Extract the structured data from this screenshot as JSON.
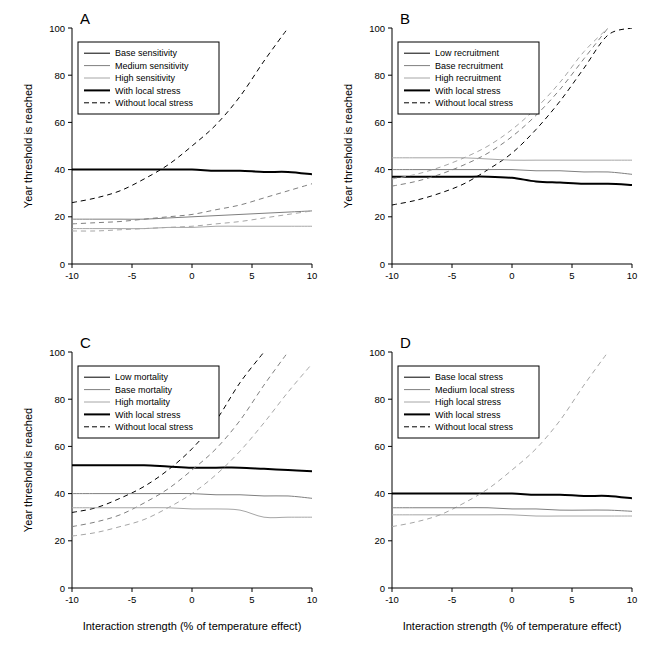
{
  "figure": {
    "background": "#ffffff",
    "axis_color": "#000000",
    "colors": {
      "black": "#000000",
      "dark_gray": "#4d4d4d",
      "mid_gray": "#7f7f7f",
      "light_gray": "#a6a6a6"
    },
    "y_axis": {
      "title": "Year threshold is reached",
      "ticks": [
        "0",
        "20",
        "40",
        "60",
        "80",
        "100"
      ],
      "min": 0,
      "max": 100
    },
    "x_axis": {
      "title": "Interaction strength (% of temperature effect)",
      "ticks": [
        "-10",
        "-5",
        "0",
        "5",
        "10"
      ],
      "min": -10,
      "max": 10
    }
  },
  "chart_data": [
    {
      "type": "line",
      "panel": "A",
      "title": "A",
      "xlabel": "",
      "ylabel": "Year threshold is reached",
      "xlim": [
        -10,
        10
      ],
      "ylim": [
        0,
        100
      ],
      "grid": false,
      "legend_position": "top-left",
      "legend": [
        {
          "label": "Base sensitivity",
          "color": "#000000",
          "dash": "solid",
          "width": 1
        },
        {
          "label": "Medium sensitivity",
          "color": "#7f7f7f",
          "dash": "solid",
          "width": 1
        },
        {
          "label": "High sensitivity",
          "color": "#a6a6a6",
          "dash": "solid",
          "width": 1
        },
        {
          "label": "With local stress",
          "color": "#000000",
          "dash": "solid",
          "width": 2
        },
        {
          "label": "Without local stress",
          "color": "#000000",
          "dash": "dashed",
          "width": 1
        }
      ],
      "x": [
        -10,
        -8,
        -6,
        -4,
        -2,
        0,
        2,
        4,
        6,
        8,
        10
      ],
      "series": [
        {
          "name": "Base sensitivity, with local stress",
          "color": "#000000",
          "dash": "solid",
          "width": 2,
          "values": [
            40,
            40,
            40,
            40,
            40,
            40,
            39.5,
            39.5,
            39,
            39,
            38
          ]
        },
        {
          "name": "Base sensitivity, without local stress",
          "color": "#000000",
          "dash": "dashed",
          "width": 1,
          "values": [
            26,
            28,
            31,
            36,
            42,
            50,
            59,
            71,
            86,
            100,
            null
          ]
        },
        {
          "name": "Medium sensitivity, with local stress",
          "color": "#7f7f7f",
          "dash": "solid",
          "width": 1,
          "values": [
            19,
            19,
            19,
            19,
            19.5,
            20,
            20.5,
            21,
            21.5,
            22,
            22.5
          ]
        },
        {
          "name": "Medium sensitivity, without local stress",
          "color": "#7f7f7f",
          "dash": "dashed",
          "width": 1,
          "values": [
            17,
            17.5,
            18,
            19,
            20,
            21,
            23,
            25,
            28,
            31,
            34
          ]
        },
        {
          "name": "High sensitivity, with local stress",
          "color": "#a6a6a6",
          "dash": "solid",
          "width": 1,
          "values": [
            15,
            15,
            15,
            15,
            15.5,
            15.5,
            16,
            16,
            16,
            16,
            16
          ]
        },
        {
          "name": "High sensitivity, without local stress",
          "color": "#a6a6a6",
          "dash": "dashed",
          "width": 1,
          "values": [
            14,
            14,
            14.5,
            15,
            15.5,
            16,
            17,
            18,
            19.5,
            21,
            22.5
          ]
        }
      ]
    },
    {
      "type": "line",
      "panel": "B",
      "title": "B",
      "xlabel": "",
      "ylabel": "Year threshold is reached",
      "xlim": [
        -10,
        10
      ],
      "ylim": [
        0,
        100
      ],
      "grid": false,
      "legend_position": "top-left",
      "legend": [
        {
          "label": "Low recruitment",
          "color": "#000000",
          "dash": "solid",
          "width": 1
        },
        {
          "label": "Base recruitment",
          "color": "#7f7f7f",
          "dash": "solid",
          "width": 1
        },
        {
          "label": "High recruitment",
          "color": "#a6a6a6",
          "dash": "solid",
          "width": 1
        },
        {
          "label": "With local stress",
          "color": "#000000",
          "dash": "solid",
          "width": 2
        },
        {
          "label": "Without local stress",
          "color": "#000000",
          "dash": "dashed",
          "width": 1
        }
      ],
      "x": [
        -10,
        -8,
        -6,
        -4,
        -2,
        0,
        2,
        4,
        6,
        8,
        10
      ],
      "series": [
        {
          "name": "Low recruitment, with local stress",
          "color": "#000000",
          "dash": "solid",
          "width": 2,
          "values": [
            37,
            37,
            37,
            37,
            37,
            36.5,
            35,
            34.5,
            34,
            34,
            33.5
          ]
        },
        {
          "name": "Low recruitment, without local stress",
          "color": "#000000",
          "dash": "dashed",
          "width": 1,
          "values": [
            25,
            27,
            30,
            34,
            40,
            47,
            57,
            69,
            83,
            97,
            100
          ]
        },
        {
          "name": "Base recruitment, with local stress",
          "color": "#7f7f7f",
          "dash": "solid",
          "width": 1,
          "values": [
            40,
            40,
            40,
            40,
            40,
            40,
            39.5,
            39.5,
            39,
            39,
            38
          ]
        },
        {
          "name": "Base recruitment, without local stress",
          "color": "#7f7f7f",
          "dash": "dashed",
          "width": 1,
          "values": [
            33,
            35,
            38,
            42,
            47,
            54,
            63,
            74,
            87,
            100,
            null
          ]
        },
        {
          "name": "High recruitment, with local stress",
          "color": "#a6a6a6",
          "dash": "solid",
          "width": 1,
          "values": [
            45,
            45,
            45,
            45,
            44.5,
            44,
            44,
            44,
            44,
            44,
            44
          ]
        },
        {
          "name": "High recruitment, without local stress",
          "color": "#a6a6a6",
          "dash": "dashed",
          "width": 1,
          "values": [
            36,
            38,
            41,
            45,
            50,
            57,
            66,
            77,
            90,
            100,
            null
          ]
        }
      ]
    },
    {
      "type": "line",
      "panel": "C",
      "title": "C",
      "xlabel": "Interaction strength (% of temperature effect)",
      "ylabel": "Year threshold is reached",
      "xlim": [
        -10,
        10
      ],
      "ylim": [
        0,
        100
      ],
      "grid": false,
      "legend_position": "top-left",
      "legend": [
        {
          "label": "Low mortality",
          "color": "#000000",
          "dash": "solid",
          "width": 1
        },
        {
          "label": "Base mortality",
          "color": "#7f7f7f",
          "dash": "solid",
          "width": 1
        },
        {
          "label": "High mortality",
          "color": "#a6a6a6",
          "dash": "solid",
          "width": 1
        },
        {
          "label": "With local stress",
          "color": "#000000",
          "dash": "solid",
          "width": 2
        },
        {
          "label": "Without local stress",
          "color": "#000000",
          "dash": "dashed",
          "width": 1
        }
      ],
      "x": [
        -10,
        -8,
        -6,
        -4,
        -2,
        0,
        2,
        4,
        6,
        8,
        10
      ],
      "series": [
        {
          "name": "Low mortality, with local stress",
          "color": "#000000",
          "dash": "solid",
          "width": 2,
          "values": [
            52,
            52,
            52,
            52,
            51.5,
            51,
            51,
            51,
            50.5,
            50,
            49.5
          ]
        },
        {
          "name": "Low mortality, without local stress",
          "color": "#000000",
          "dash": "dashed",
          "width": 1,
          "values": [
            32,
            34,
            38,
            43,
            50,
            59,
            71,
            87,
            100,
            null,
            null
          ]
        },
        {
          "name": "Base mortality, with local stress",
          "color": "#7f7f7f",
          "dash": "solid",
          "width": 1,
          "values": [
            40,
            40,
            40,
            40,
            40,
            40,
            39.5,
            39.5,
            39,
            39,
            38
          ]
        },
        {
          "name": "Base mortality, without local stress",
          "color": "#7f7f7f",
          "dash": "dashed",
          "width": 1,
          "values": [
            26,
            28,
            31,
            36,
            42,
            50,
            59,
            71,
            86,
            100,
            null
          ]
        },
        {
          "name": "High mortality, with local stress",
          "color": "#a6a6a6",
          "dash": "solid",
          "width": 1,
          "values": [
            34,
            34,
            34,
            34,
            34,
            33.5,
            33.5,
            33,
            30,
            30,
            30
          ]
        },
        {
          "name": "High mortality, without local stress",
          "color": "#a6a6a6",
          "dash": "dashed",
          "width": 1,
          "values": [
            22,
            23.5,
            26,
            29,
            34,
            40,
            48,
            58,
            70,
            83,
            95
          ]
        }
      ]
    },
    {
      "type": "line",
      "panel": "D",
      "title": "D",
      "xlabel": "Interaction strength (% of temperature effect)",
      "ylabel": "",
      "xlim": [
        -10,
        10
      ],
      "ylim": [
        0,
        100
      ],
      "grid": false,
      "legend_position": "top-left",
      "legend": [
        {
          "label": "Base local stress",
          "color": "#000000",
          "dash": "solid",
          "width": 1
        },
        {
          "label": "Medium local stress",
          "color": "#7f7f7f",
          "dash": "solid",
          "width": 1
        },
        {
          "label": "High local stress",
          "color": "#a6a6a6",
          "dash": "solid",
          "width": 1
        },
        {
          "label": "With local stress",
          "color": "#000000",
          "dash": "solid",
          "width": 2
        },
        {
          "label": "Without local stress",
          "color": "#000000",
          "dash": "dashed",
          "width": 1
        }
      ],
      "x": [
        -10,
        -8,
        -6,
        -4,
        -2,
        0,
        2,
        4,
        6,
        8,
        10
      ],
      "series": [
        {
          "name": "Base local stress, with local stress",
          "color": "#000000",
          "dash": "solid",
          "width": 2,
          "values": [
            40,
            40,
            40,
            40,
            40,
            40,
            39.5,
            39.5,
            39,
            39,
            38
          ]
        },
        {
          "name": "Base local stress, without local stress",
          "color": "#a6a6a6",
          "dash": "dashed",
          "width": 1,
          "values": [
            26,
            28,
            31,
            36,
            42,
            50,
            59,
            71,
            86,
            100,
            null
          ]
        },
        {
          "name": "Medium local stress, with local stress",
          "color": "#7f7f7f",
          "dash": "solid",
          "width": 1,
          "values": [
            34,
            34,
            34,
            34,
            34,
            33.5,
            33.5,
            33,
            33,
            33,
            32.5
          ]
        },
        {
          "name": "High local stress, with local stress",
          "color": "#a6a6a6",
          "dash": "solid",
          "width": 1,
          "values": [
            31,
            31,
            31,
            31,
            31,
            31,
            30.5,
            30.5,
            30.5,
            30.5,
            30.5
          ]
        }
      ]
    }
  ]
}
